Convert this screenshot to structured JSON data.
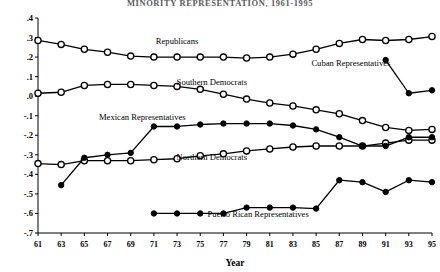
{
  "chart_data": {
    "type": "line",
    "title": "MINORITY REPRESENTATION, 1961-1995",
    "xlabel": "Year",
    "ylabel": "",
    "xlim": [
      61,
      95
    ],
    "ylim": [
      -0.7,
      0.4
    ],
    "grid": false,
    "legend_position": "inline-annotations",
    "xticks": [
      "61",
      "63",
      "65",
      "67",
      "69",
      "71",
      "73",
      "75",
      "77",
      "79",
      "81",
      "83",
      "85",
      "87",
      "89",
      "91",
      "93",
      "95"
    ],
    "yticks": [
      ".4",
      ".3",
      ".2",
      ".1",
      ".0",
      "-.1",
      "-.2",
      "-.3",
      "-.4",
      "-.5",
      "-.6",
      "-.7"
    ],
    "x": [
      61,
      63,
      65,
      67,
      69,
      71,
      73,
      75,
      77,
      79,
      81,
      83,
      85,
      87,
      89,
      91,
      93,
      95
    ],
    "series": [
      {
        "name": "Republicans",
        "marker": "open-circle",
        "x": [
          61,
          63,
          65,
          67,
          69,
          71,
          73,
          75,
          77,
          79,
          81,
          83,
          85,
          87,
          89,
          91,
          93,
          95
        ],
        "values": [
          0.285,
          0.265,
          0.24,
          0.225,
          0.205,
          0.2,
          0.2,
          0.2,
          0.2,
          0.195,
          0.2,
          0.215,
          0.24,
          0.27,
          0.29,
          0.285,
          0.29,
          0.305
        ],
        "label_x": 73,
        "label_y": 0.265
      },
      {
        "name": "Southern Democrats",
        "marker": "open-circle",
        "x": [
          61,
          63,
          65,
          67,
          69,
          71,
          73,
          75,
          77,
          79,
          81,
          83,
          85,
          87,
          89,
          91,
          93,
          95
        ],
        "values": [
          0.015,
          0.02,
          0.055,
          0.06,
          0.06,
          0.055,
          0.05,
          0.035,
          0.01,
          -0.015,
          -0.035,
          -0.05,
          -0.07,
          -0.09,
          -0.125,
          -0.16,
          -0.175,
          -0.17
        ],
        "label_x": 76,
        "label_y": 0.055
      },
      {
        "name": "Northern Democrats",
        "marker": "open-circle",
        "x": [
          61,
          63,
          65,
          67,
          69,
          71,
          73,
          75,
          77,
          79,
          81,
          83,
          85,
          87,
          89,
          91,
          93,
          95
        ],
        "values": [
          -0.345,
          -0.35,
          -0.33,
          -0.33,
          -0.33,
          -0.325,
          -0.32,
          -0.305,
          -0.295,
          -0.28,
          -0.27,
          -0.26,
          -0.255,
          -0.255,
          -0.255,
          -0.24,
          -0.225,
          -0.225
        ],
        "label_x": 76,
        "label_y": -0.325
      },
      {
        "name": "Mexican Representatives",
        "marker": "filled-circle",
        "x": [
          63,
          65,
          67,
          69,
          71,
          73,
          75,
          77,
          79,
          81,
          83,
          85,
          87,
          89,
          91,
          93,
          95
        ],
        "values": [
          -0.455,
          -0.315,
          -0.3,
          -0.29,
          -0.155,
          -0.155,
          -0.145,
          -0.14,
          -0.14,
          -0.14,
          -0.15,
          -0.17,
          -0.21,
          -0.255,
          -0.255,
          -0.21,
          -0.21
        ],
        "label_x": 70,
        "label_y": -0.12
      },
      {
        "name": "Puerto Rican Representatives",
        "marker": "filled-circle",
        "x": [
          71,
          73,
          75,
          77,
          79,
          81,
          83,
          85,
          87,
          89,
          91,
          93,
          95
        ],
        "values": [
          -0.6,
          -0.6,
          -0.6,
          -0.6,
          -0.57,
          -0.57,
          -0.57,
          -0.575,
          -0.43,
          -0.44,
          -0.49,
          -0.43,
          -0.44
        ],
        "label_x": 80,
        "label_y": -0.62
      },
      {
        "name": "Cuban Representatives",
        "marker": "filled-circle",
        "x": [
          91,
          93,
          95
        ],
        "values": [
          0.185,
          0.015,
          0.03
        ],
        "label_x": 88,
        "label_y": 0.155
      }
    ]
  }
}
